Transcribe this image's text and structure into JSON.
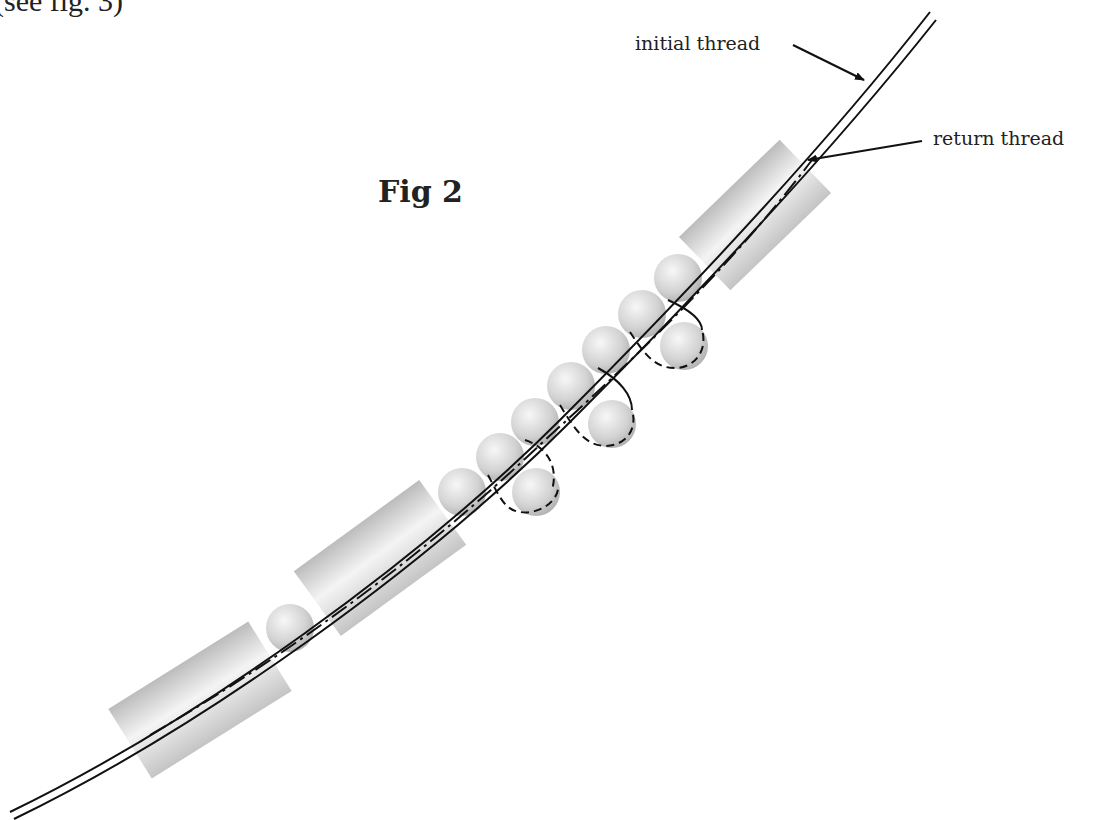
{
  "caption_fragment": "(see fig. 3)",
  "figure": {
    "title": "Fig 2",
    "labels": {
      "initial_thread": "initial thread",
      "return_thread": "return thread"
    },
    "colors": {
      "thread": "#111111",
      "tube_light": "#f2f2f2",
      "tube_dark": "#b8b8b8",
      "bead_light": "#f5f5f5",
      "bead_dark": "#a9a9a9",
      "text": "#222222"
    },
    "tubes": [
      {
        "cx": 200,
        "cy": 700,
        "len": 165,
        "w": 82,
        "angle": -32
      },
      {
        "cx": 380,
        "cy": 558,
        "len": 155,
        "w": 80,
        "angle": -36
      },
      {
        "cx": 755,
        "cy": 215,
        "len": 140,
        "w": 74,
        "angle": -44
      }
    ],
    "beads": [
      {
        "cx": 290,
        "cy": 628,
        "r": 24
      },
      {
        "cx": 462,
        "cy": 492,
        "r": 24
      },
      {
        "cx": 500,
        "cy": 457,
        "r": 24
      },
      {
        "cx": 535,
        "cy": 422,
        "r": 24
      },
      {
        "cx": 571,
        "cy": 386,
        "r": 24
      },
      {
        "cx": 606,
        "cy": 350,
        "r": 24
      },
      {
        "cx": 642,
        "cy": 314,
        "r": 24
      },
      {
        "cx": 678,
        "cy": 278,
        "r": 24
      },
      {
        "cx": 536,
        "cy": 492,
        "r": 24
      },
      {
        "cx": 612,
        "cy": 424,
        "r": 24
      },
      {
        "cx": 684,
        "cy": 346,
        "r": 24
      }
    ]
  }
}
